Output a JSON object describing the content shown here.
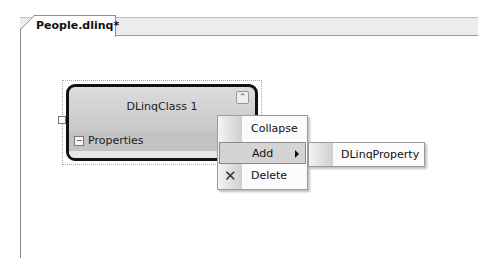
{
  "document_tab": {
    "label": "People.dlinq*"
  },
  "designer": {
    "class_shape": {
      "title": "DLinqClass 1",
      "compartment": "Properties"
    }
  },
  "context_menu": {
    "items": [
      {
        "label": "Collapse"
      },
      {
        "label": "Add",
        "has_submenu": true,
        "highlighted": true
      },
      {
        "label": "Delete",
        "icon": "delete-x-icon"
      }
    ]
  },
  "submenu": {
    "items": [
      {
        "label": "DLinqProperty"
      }
    ]
  }
}
